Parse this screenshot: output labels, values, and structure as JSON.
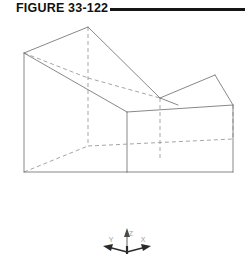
{
  "figure": {
    "title": "FIGURE 33-122",
    "rule_color": "#151515",
    "background": "#ffffff"
  },
  "drawing": {
    "name": "isometric-notched-block",
    "description": "Isometric wireframe pictorial of a rectangular block with a rectangular notch cut into the top front",
    "visible_line_color": "#7a7a7a",
    "hidden_line_color": "#9b9b9b",
    "line_width": 0.9,
    "hidden_dash_pattern": "4,3",
    "visible_edges": [
      {
        "name": "top-left-rear-ridge",
        "points": "24,35 88,9"
      },
      {
        "name": "top-left-front-slope",
        "points": "24,35 127,94"
      },
      {
        "name": "notch-left-diagonal",
        "points": "88,9 160,80"
      },
      {
        "name": "notch-top-rear",
        "points": "160,80 215,57"
      },
      {
        "name": "notch-right-face",
        "points": "160,80 178,87"
      },
      {
        "name": "top-right-rear-edge",
        "points": "215,57 233,87"
      },
      {
        "name": "top-right-front-slope",
        "points": "127,94 233,87"
      },
      {
        "name": "front-left-vertical",
        "points": "24,35 24,154"
      },
      {
        "name": "front-center-vertical",
        "points": "127,94 127,154"
      },
      {
        "name": "front-right-vertical",
        "points": "233,87 233,154"
      },
      {
        "name": "bottom-left-front",
        "points": "24,154 127,154"
      },
      {
        "name": "bottom-right-front",
        "points": "127,154 233,154"
      }
    ],
    "hidden_edges": [
      {
        "name": "rear-vertical-from-apex",
        "points": "88,9 88,128"
      },
      {
        "name": "rear-top-left-dashed",
        "points": "24,35 88,60"
      },
      {
        "name": "notch-bottom-dashed",
        "points": "88,60 160,80"
      },
      {
        "name": "notch-inner-vertical",
        "points": "160,80 160,140"
      },
      {
        "name": "bottom-rear-left-dashed",
        "points": "24,154 88,128"
      },
      {
        "name": "bottom-rear-right-dashed",
        "points": "88,128 233,121"
      },
      {
        "name": "bottom-rear-right-vertical",
        "points": "233,87 233,121"
      }
    ]
  },
  "axis_triad": {
    "name": "coordinate-axis-indicator",
    "origin": {
      "x": 127,
      "y": 234
    },
    "arrow_color": "#2b2b2b",
    "label_color": "#9a9a9a",
    "axes": [
      {
        "id": "y",
        "label": "Y",
        "direction": "lower-left",
        "tip": {
          "x": 104,
          "y": 234
        },
        "label_pos": {
          "x": 111,
          "y": 224
        }
      },
      {
        "id": "z",
        "label": "Z",
        "direction": "up",
        "tip": {
          "x": 127,
          "y": 212
        },
        "label_pos": {
          "x": 131,
          "y": 218
        }
      },
      {
        "id": "x",
        "label": "X",
        "direction": "lower-right",
        "tip": {
          "x": 150,
          "y": 234
        },
        "label_pos": {
          "x": 143,
          "y": 224
        }
      }
    ]
  }
}
